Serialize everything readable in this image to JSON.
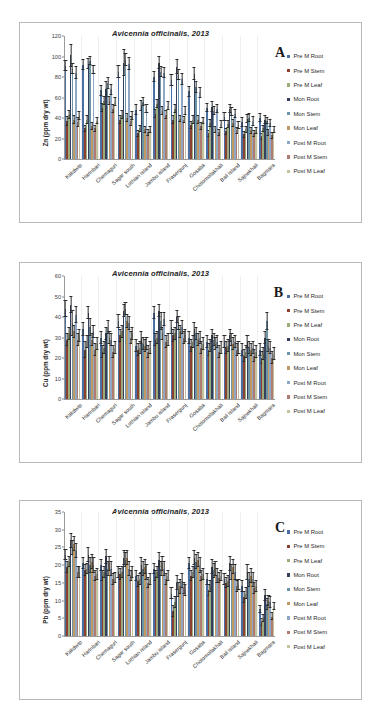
{
  "top_caption": "",
  "series": [
    {
      "name": "Pre M Root",
      "color": "#4a6fa5"
    },
    {
      "name": "Pre M Stem",
      "color": "#8c4030"
    },
    {
      "name": "Pre M Leaf",
      "color": "#9bab7a"
    },
    {
      "name": "Mon Root",
      "color": "#36405c"
    },
    {
      "name": "Mon Stem",
      "color": "#6d95a8"
    },
    {
      "name": "Mon Leaf",
      "color": "#c19a62"
    },
    {
      "name": "Post M Root",
      "color": "#8fa6c4"
    },
    {
      "name": "Post M Stem",
      "color": "#b07c72"
    },
    {
      "name": "Post M Leaf",
      "color": "#c2c4a0"
    }
  ],
  "sites": [
    "Kakdwip",
    "Harinbari",
    "Chemaguri",
    "Sagar south",
    "Lothian island",
    "Jambu island",
    "Frasergunj",
    "Gosaba",
    "Chotomollakhali",
    "Bali island",
    "Sajnekhali",
    "Bagmara"
  ],
  "chart_data": [
    {
      "id": "A",
      "type": "bar",
      "title": "Avicennia officinalis, 2013",
      "panel_letter": "A",
      "xlabel": "",
      "ylabel": "Zn (ppm dry wt)",
      "ylim": [
        0,
        120
      ],
      "yticks": [
        0,
        20,
        40,
        60,
        80,
        100,
        120
      ],
      "grid": false,
      "legend_position": "right",
      "categories": [
        "Kakdwip",
        "Harinbari",
        "Chemaguri",
        "Sagar south",
        "Lothian island",
        "Jambu island",
        "Frasergunj",
        "Gosaba",
        "Chotomollakhali",
        "Bali island",
        "Sajnekhali",
        "Bagmara"
      ],
      "series": [
        {
          "name": "Pre M Root",
          "values": [
            91,
            92,
            67,
            85,
            48,
            80,
            77,
            66,
            50,
            41,
            36,
            40
          ],
          "errors": [
            5,
            5,
            5,
            6,
            5,
            5,
            5,
            5,
            4,
            4,
            4,
            4
          ]
        },
        {
          "name": "Pre M Stem",
          "values": [
            37,
            30,
            50,
            38,
            25,
            44,
            38,
            33,
            25,
            27,
            24,
            22
          ],
          "errors": [
            4,
            3,
            4,
            4,
            3,
            4,
            4,
            3,
            3,
            3,
            3,
            3
          ]
        },
        {
          "name": "Pre M Leaf",
          "values": [
            43,
            38,
            57,
            43,
            30,
            54,
            49,
            38,
            35,
            34,
            29,
            30
          ],
          "errors": [
            4,
            4,
            4,
            4,
            3,
            4,
            4,
            4,
            3,
            3,
            3,
            3
          ]
        },
        {
          "name": "Mon Root",
          "values": [
            101,
            93,
            68,
            94,
            52,
            94,
            90,
            83,
            51,
            49,
            39,
            38
          ],
          "errors": [
            11,
            5,
            7,
            13,
            5,
            6,
            7,
            6,
            5,
            4,
            4,
            4
          ]
        },
        {
          "name": "Mon Stem",
          "values": [
            88,
            96,
            74,
            97,
            56,
            85,
            82,
            70,
            47,
            46,
            40,
            37
          ],
          "errors": [
            5,
            4,
            5,
            6,
            4,
            5,
            5,
            5,
            4,
            4,
            4,
            3
          ]
        },
        {
          "name": "Mon Leaf",
          "values": [
            38,
            32,
            57,
            40,
            29,
            47,
            39,
            38,
            29,
            35,
            28,
            26
          ],
          "errors": [
            4,
            3,
            4,
            4,
            3,
            4,
            3,
            4,
            3,
            3,
            3,
            3
          ]
        },
        {
          "name": "Post M Root",
          "values": [
            84,
            87,
            68,
            93,
            49,
            84,
            78,
            65,
            49,
            44,
            37,
            35
          ],
          "errors": [
            6,
            4,
            5,
            6,
            4,
            5,
            5,
            5,
            4,
            4,
            4,
            3
          ]
        },
        {
          "name": "Post M Stem",
          "values": [
            36,
            30,
            49,
            37,
            26,
            43,
            38,
            32,
            26,
            28,
            25,
            23
          ],
          "errors": [
            4,
            3,
            4,
            4,
            3,
            4,
            3,
            3,
            3,
            3,
            3,
            3
          ]
        },
        {
          "name": "Post M Leaf",
          "values": [
            42,
            37,
            56,
            42,
            29,
            52,
            47,
            37,
            34,
            33,
            28,
            29
          ],
          "errors": [
            4,
            3,
            4,
            4,
            3,
            4,
            4,
            3,
            3,
            3,
            3,
            3
          ]
        }
      ]
    },
    {
      "id": "B",
      "type": "bar",
      "title": "Avicennia officinalis, 2013",
      "panel_letter": "B",
      "xlabel": "",
      "ylabel": "Cu (ppm dry wt)",
      "ylim": [
        0,
        60
      ],
      "yticks": [
        0,
        10,
        20,
        30,
        40,
        50,
        60
      ],
      "grid": false,
      "legend_position": "right",
      "categories": [
        "Kakdwip",
        "Harinbari",
        "Chemaguri",
        "Sagar south",
        "Lothian island",
        "Jambu island",
        "Frasergunj",
        "Gosaba",
        "Chotomollakhali",
        "Bali island",
        "Sajnekhali",
        "Bagmara"
      ],
      "series": [
        {
          "name": "Pre M Root",
          "values": [
            44,
            34,
            30,
            38,
            26,
            42,
            35,
            30,
            28,
            28,
            24,
            24
          ],
          "errors": [
            4,
            3,
            3,
            3,
            3,
            3,
            3,
            3,
            3,
            3,
            3,
            3
          ]
        },
        {
          "name": "Pre M Stem",
          "values": [
            29,
            24,
            23,
            31,
            24,
            29,
            31,
            26,
            24,
            25,
            21,
            20
          ],
          "errors": [
            3,
            4,
            3,
            3,
            3,
            3,
            3,
            3,
            3,
            3,
            3,
            3
          ]
        },
        {
          "name": "Pre M Leaf",
          "values": [
            32,
            28,
            25,
            33,
            25,
            30,
            32,
            28,
            26,
            26,
            23,
            22
          ],
          "errors": [
            3,
            3,
            3,
            3,
            3,
            3,
            3,
            3,
            3,
            3,
            3,
            3
          ]
        },
        {
          "name": "Mon Root",
          "values": [
            46,
            42,
            32,
            43,
            30,
            43,
            40,
            34,
            31,
            31,
            28,
            30
          ],
          "errors": [
            4,
            3,
            3,
            3,
            3,
            3,
            3,
            3,
            3,
            3,
            3,
            3
          ]
        },
        {
          "name": "Mon Stem",
          "values": [
            37,
            35,
            35,
            44,
            27,
            38,
            37,
            32,
            29,
            29,
            25,
            38
          ],
          "errors": [
            6,
            4,
            3,
            3,
            3,
            4,
            3,
            3,
            3,
            3,
            3,
            4
          ]
        },
        {
          "name": "Mon Leaf",
          "values": [
            33,
            29,
            30,
            38,
            26,
            32,
            33,
            29,
            27,
            27,
            24,
            26
          ],
          "errors": [
            3,
            3,
            3,
            3,
            3,
            3,
            3,
            3,
            3,
            3,
            3,
            3
          ]
        },
        {
          "name": "Post M Root",
          "values": [
            41,
            33,
            29,
            37,
            27,
            39,
            35,
            30,
            28,
            28,
            25,
            25
          ],
          "errors": [
            4,
            3,
            3,
            3,
            3,
            3,
            3,
            3,
            3,
            3,
            3,
            3
          ]
        },
        {
          "name": "Post M Stem",
          "values": [
            29,
            24,
            23,
            30,
            23,
            28,
            30,
            25,
            23,
            24,
            21,
            20
          ],
          "errors": [
            3,
            3,
            3,
            3,
            3,
            3,
            3,
            3,
            3,
            3,
            3,
            3
          ]
        },
        {
          "name": "Post M Leaf",
          "values": [
            31,
            27,
            25,
            32,
            25,
            29,
            31,
            27,
            25,
            25,
            23,
            22
          ],
          "errors": [
            3,
            3,
            3,
            3,
            3,
            3,
            3,
            3,
            3,
            3,
            3,
            3
          ]
        }
      ]
    },
    {
      "id": "C",
      "type": "bar",
      "title": "Avicennia officinalis, 2013",
      "panel_letter": "C",
      "xlabel": "",
      "ylabel": "Pb (ppm dry wt)",
      "ylim": [
        0,
        35
      ],
      "yticks": [
        0,
        5,
        10,
        15,
        20,
        25,
        30,
        35
      ],
      "grid": false,
      "legend_position": "right",
      "categories": [
        "Kakdwip",
        "Harinbari",
        "Chemaguri",
        "Sagar south",
        "Lothian island",
        "Jambu island",
        "Frasergunj",
        "Gosaba",
        "Chotomollakhali",
        "Bali island",
        "Sajnekhali",
        "Bagmara"
      ],
      "series": [
        {
          "name": "Pre M Root",
          "values": [
            23,
            20.5,
            20,
            18,
            17,
            19,
            12,
            20.5,
            16,
            16,
            14,
            7.5
          ],
          "errors": [
            1.5,
            1.5,
            1.5,
            1.5,
            1.5,
            1.5,
            1.5,
            1.5,
            1.5,
            1.5,
            1.5,
            1
          ]
        },
        {
          "name": "Pre M Stem",
          "values": [
            19.5,
            18.5,
            17,
            17.5,
            15.5,
            17,
            7,
            17,
            13,
            15,
            11,
            4
          ],
          "errors": [
            1.5,
            1.5,
            1.5,
            1.5,
            1.5,
            1.5,
            1.5,
            1.5,
            1.5,
            1.5,
            1.5,
            1
          ]
        },
        {
          "name": "Pre M Leaf",
          "values": [
            21,
            19,
            18,
            18,
            16,
            18,
            9.5,
            18,
            14,
            15.5,
            12,
            5
          ],
          "errors": [
            1.5,
            1.5,
            1.5,
            1.5,
            1.5,
            1.5,
            1.5,
            1.5,
            1.5,
            1.5,
            1.5,
            1
          ]
        },
        {
          "name": "Mon Root",
          "values": [
            27,
            23,
            22.5,
            22,
            20,
            21.5,
            15,
            22,
            19.5,
            20.5,
            18,
            11.5
          ],
          "errors": [
            2,
            2,
            2,
            2,
            2,
            2,
            2,
            2,
            2,
            2,
            2,
            1.5
          ]
        },
        {
          "name": "Mon Stem",
          "values": [
            25,
            20,
            19,
            21.5,
            19,
            19,
            13,
            21,
            18.5,
            18,
            16,
            9
          ],
          "errors": [
            2,
            2,
            2,
            2,
            2,
            2,
            2,
            2,
            2,
            2,
            2,
            1.5
          ]
        },
        {
          "name": "Mon Leaf",
          "values": [
            26,
            21,
            20.5,
            22,
            19.5,
            20.5,
            14,
            21.5,
            19,
            19.5,
            17,
            10
          ],
          "errors": [
            2,
            2,
            2,
            2,
            2,
            2,
            2,
            2,
            2,
            2,
            2,
            1.5
          ]
        },
        {
          "name": "Post M Root",
          "values": [
            24,
            20,
            19,
            19,
            18,
            19,
            15.5,
            20,
            17,
            18,
            16,
            9.5
          ],
          "errors": [
            2,
            2,
            2,
            2,
            2,
            2,
            2,
            2,
            2,
            2,
            2,
            1.5
          ]
        },
        {
          "name": "Post M Stem",
          "values": [
            18,
            17,
            16,
            17,
            15,
            16,
            13.5,
            17,
            16.5,
            14,
            13.5,
            5.5
          ],
          "errors": [
            1.5,
            1.5,
            1.5,
            1.5,
            1.5,
            1.5,
            1.5,
            1.5,
            1.5,
            1.5,
            1.5,
            1
          ]
        },
        {
          "name": "Post M Leaf",
          "values": [
            18,
            17.5,
            16.5,
            18,
            16,
            17,
            13,
            17.5,
            17,
            14.5,
            14,
            8.5
          ],
          "errors": [
            1.5,
            1.5,
            1.5,
            1.5,
            1.5,
            1.5,
            1.5,
            1.5,
            1.5,
            1.5,
            1.5,
            1
          ]
        }
      ]
    }
  ]
}
